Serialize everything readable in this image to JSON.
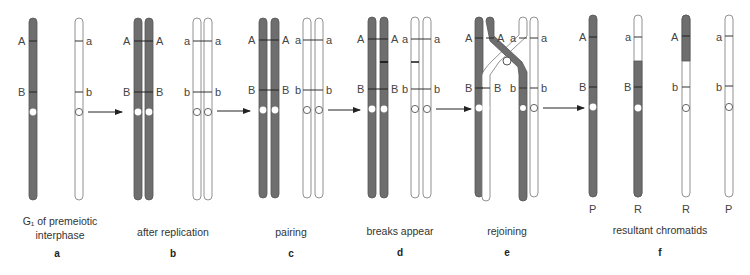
{
  "colors": {
    "dark": "#6e6e6e",
    "dark_stroke": "#555555",
    "light_fill": "#ffffff",
    "light_stroke": "#777777",
    "text": "#444444"
  },
  "stages": [
    {
      "letter": "a",
      "caption_line1": "G₁ of premeiotic",
      "caption_line2": "interphase"
    },
    {
      "letter": "b",
      "caption_line1": "after replication"
    },
    {
      "letter": "c",
      "caption_line1": "pairing"
    },
    {
      "letter": "d",
      "caption_line1": "breaks appear"
    },
    {
      "letter": "e",
      "caption_line1": "rejoining"
    },
    {
      "letter": "f",
      "caption_line1": "resultant chromatids"
    }
  ],
  "gene_labels": {
    "A": "A",
    "a": "a",
    "B": "B",
    "b": "b"
  },
  "chromatid_types": {
    "P": "P",
    "R": "R"
  },
  "arrow_icon": "right-arrow"
}
